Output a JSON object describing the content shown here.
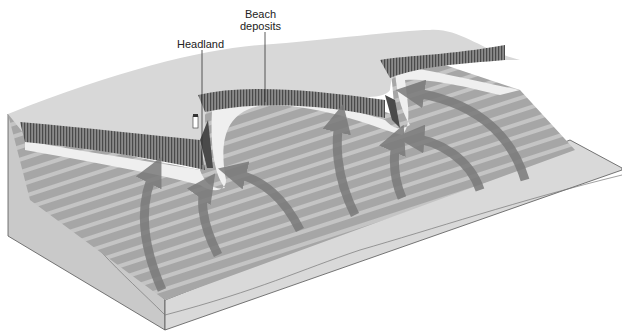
{
  "diagram": {
    "labels": {
      "headland": "Headland",
      "beach_line1": "Beach",
      "beach_line2": "deposits"
    },
    "elements": [
      "land surface",
      "sea cliffs",
      "beach deposits",
      "wave crests",
      "wave rays (arrows)",
      "block cross-section"
    ],
    "colors": {
      "land": "#d6d6d6",
      "cliff": "#6e6e6e",
      "beach": "#ececec",
      "sea": "#a8a8a8",
      "wave_crest": "#c8c8c8",
      "arrow": "#7a7a7a",
      "block_side": "#cfcfcf",
      "outline": "#555555"
    }
  }
}
